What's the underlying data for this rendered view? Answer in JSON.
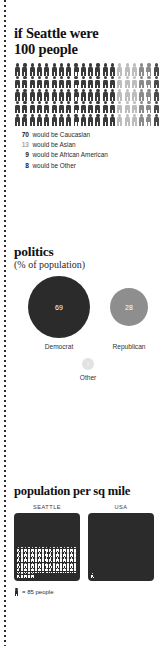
{
  "people_section": {
    "title_line1": "if Seattle were",
    "title_line2": "100 people",
    "grid": {
      "total": 100,
      "columns": 20,
      "rows": 5,
      "groups": [
        {
          "name": "Caucasian",
          "count": 70,
          "color": "#3a3a3a"
        },
        {
          "name": "Asian",
          "count": 13,
          "color": "#bdbdbd"
        },
        {
          "name": "African American",
          "count": 9,
          "color": "#8a8a8a"
        },
        {
          "name": "Other",
          "count": 8,
          "color": "#4a4a4a"
        }
      ]
    },
    "legend": [
      {
        "number": "70",
        "text": "would be Caucasian",
        "color": "#3a3a3a"
      },
      {
        "number": "13",
        "text": "would be Asian",
        "color": "#bdbdbd"
      },
      {
        "number": "9",
        "text": "would be African American",
        "color": "#8a8a8a"
      },
      {
        "number": "8",
        "text": "would be Other",
        "color": "#4a4a4a"
      }
    ]
  },
  "politics_section": {
    "title": "politics",
    "subtitle": "(% of population)",
    "bubbles": [
      {
        "label": "Democrat",
        "value": "69",
        "color": "#2b2b2b"
      },
      {
        "label": "Republican",
        "value": "28",
        "color": "#8e8e8e"
      },
      {
        "label": "Other",
        "value": "3",
        "color": "#e2e2e2"
      }
    ]
  },
  "density_section": {
    "title": "population per sq mile",
    "boxes": [
      {
        "caption": "SEATTLE",
        "figures": 90
      },
      {
        "caption": "USA",
        "figures": 1
      }
    ],
    "key_text": "= 85 people"
  },
  "chart_data": [
    {
      "type": "pictogram",
      "title": "if Seattle were 100 people",
      "categories": [
        "Caucasian",
        "Asian",
        "African American",
        "Other"
      ],
      "values": [
        70,
        13,
        9,
        8
      ],
      "unit": "people per 100",
      "total": 100,
      "grid_columns": 20,
      "grid_rows": 5,
      "colors": [
        "#3a3a3a",
        "#bdbdbd",
        "#8a8a8a",
        "#4a4a4a"
      ]
    },
    {
      "type": "bubble",
      "title": "politics",
      "subtitle": "(% of population)",
      "categories": [
        "Democrat",
        "Republican",
        "Other"
      ],
      "values": [
        69,
        28,
        3
      ],
      "ylabel": "% of population",
      "colors": [
        "#2b2b2b",
        "#8e8e8e",
        "#e2e2e2"
      ]
    },
    {
      "type": "pictogram",
      "title": "population per sq mile",
      "categories": [
        "SEATTLE",
        "USA"
      ],
      "values": [
        7650,
        85
      ],
      "unit": "people per sq mile",
      "icon_value": 85,
      "icons": [
        90,
        1
      ],
      "legend": "1 figure = 85 people"
    }
  ]
}
